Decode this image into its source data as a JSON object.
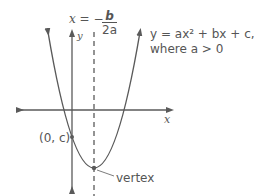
{
  "diagram": {
    "axis_of_symmetry_lhs": "x = −",
    "axis_of_symmetry_num": "b",
    "axis_of_symmetry_den": "2a",
    "equation_line1": "y = ax² + bx + c,",
    "equation_line2": "where a > 0",
    "x_axis_label": "x",
    "y_axis_label": "y",
    "y_intercept_label": "(0, c)",
    "vertex_label": "vertex",
    "colors": {
      "curve": "#5a5a5a",
      "text": "#555555"
    }
  }
}
